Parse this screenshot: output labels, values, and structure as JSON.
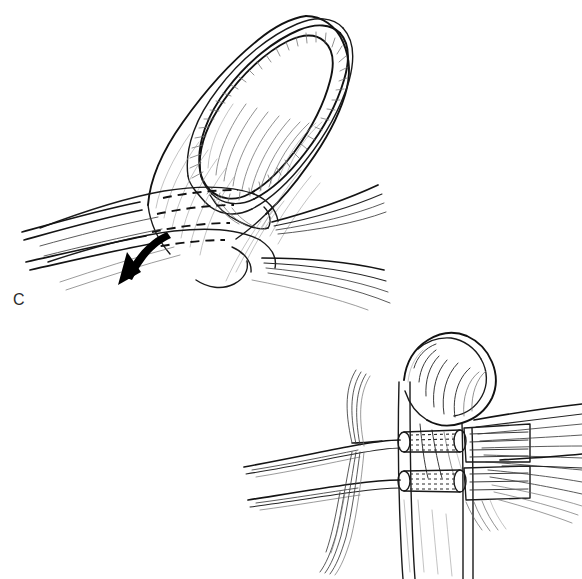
{
  "figure": {
    "caption_letter": "C",
    "background_color": "#ffffff",
    "ink_color": "#121212",
    "accent_color": "#000000",
    "width": 582,
    "height": 579,
    "style": "black-and-white pen-and-ink medical line drawing",
    "panels": [
      {
        "id": "panel-c",
        "label": "C",
        "label_x": 13,
        "label_y": 292,
        "view": "dorsal oblique view of distal finger",
        "description": "Fingertip with nail plate elevated from the eponychial fold, pull-out sutures passing beneath the nail bed and exiting distally; a curved arrow indicates the direction the suture limbs are drawn.",
        "elements": [
          {
            "name": "finger-outline",
            "type": "outline"
          },
          {
            "name": "nail-plate",
            "type": "outline"
          },
          {
            "name": "eponychial-fold",
            "type": "outline"
          },
          {
            "name": "nail-fold-hatching",
            "type": "hatching"
          },
          {
            "name": "germinal-matrix",
            "type": "outline"
          },
          {
            "name": "suture-dashed-segments",
            "type": "dashed",
            "count": 4
          },
          {
            "name": "suture-strands-left",
            "type": "strands",
            "count": 6
          },
          {
            "name": "suture-strands-right",
            "type": "strands",
            "count": 9
          },
          {
            "name": "direction-arrow",
            "type": "arrow",
            "direction": "down-left",
            "color": "#000000"
          }
        ]
      },
      {
        "id": "panel-lateral",
        "label": "",
        "view": "lateral cross-section of distal phalanx",
        "description": "Sagittal view of the distal phalanx and nail complex showing two transosseous bone tunnels with stippled suture tracks and the tendon stump with fanning suture limbs.",
        "elements": [
          {
            "name": "distal-phalanx-bone",
            "type": "outline"
          },
          {
            "name": "nail-plate-lateral",
            "type": "outline"
          },
          {
            "name": "bone-tunnel-proximal",
            "type": "tunnel"
          },
          {
            "name": "bone-tunnel-distal",
            "type": "tunnel"
          },
          {
            "name": "tunnel-stipple",
            "type": "stipple"
          },
          {
            "name": "tendon-stump",
            "type": "outline"
          },
          {
            "name": "suture-strands-left-upper",
            "type": "strands",
            "count": 4
          },
          {
            "name": "suture-strands-left-lower",
            "type": "strands",
            "count": 4
          },
          {
            "name": "suture-strands-right-fan",
            "type": "strands",
            "count": 14
          }
        ]
      }
    ]
  }
}
